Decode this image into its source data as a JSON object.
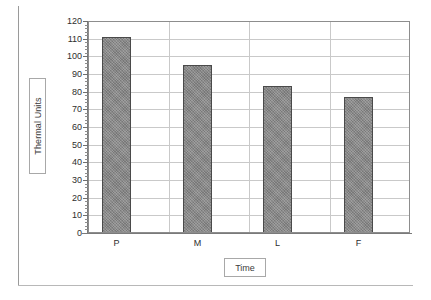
{
  "chart_data": {
    "type": "bar",
    "title": "",
    "subtitle": "",
    "categories": [
      "P",
      "M",
      "L",
      "F"
    ],
    "values": [
      111,
      95,
      83,
      77
    ],
    "series": [
      {
        "name": "Thermal Units",
        "values": [
          111,
          95,
          83,
          77
        ]
      }
    ],
    "xlabel": "Time",
    "ylabel": "Thermal Units",
    "ylim": [
      0,
      120
    ],
    "ytick_step": 10,
    "yticks": [
      0,
      10,
      20,
      30,
      40,
      50,
      60,
      70,
      80,
      90,
      100,
      110,
      120
    ],
    "ytick_labels": [
      "0",
      "10",
      "20",
      "30",
      "40",
      "50",
      "60",
      "70",
      "80",
      "90",
      "100",
      "110",
      "120"
    ],
    "grid": {
      "horizontal": true,
      "vertical": true,
      "color": "#c9c9c9"
    },
    "legend": {
      "visible": false,
      "position": "none",
      "entries": []
    },
    "annotations": [],
    "colors": {
      "bar_fill": "#8a8a8a",
      "bar_border": "#4a4a4a",
      "grid": "#c9c9c9",
      "axis": "#7a7a7a",
      "plot_border": "#8d8d8d",
      "text": "#2e2e2e",
      "background": "#ffffff"
    }
  }
}
